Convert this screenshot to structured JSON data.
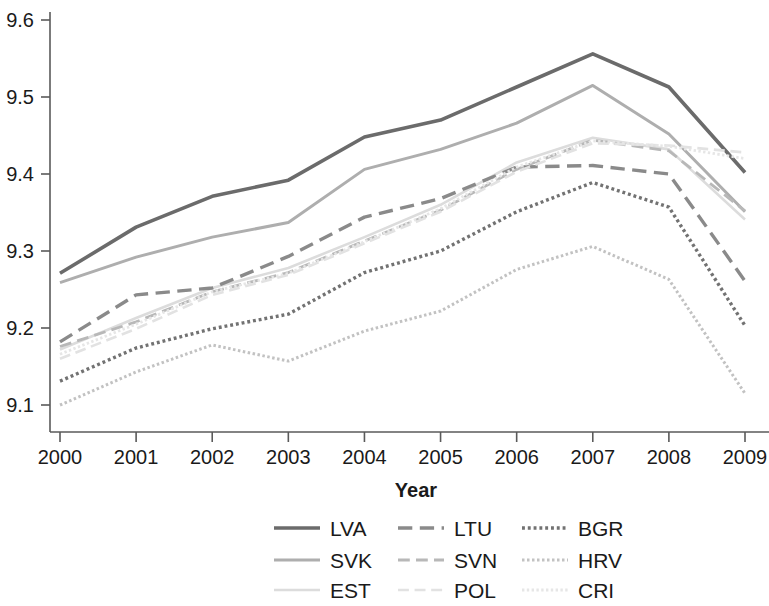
{
  "chart_data": {
    "type": "line",
    "title": "",
    "xlabel": "Year",
    "ylabel": "",
    "x": [
      2000,
      2001,
      2002,
      2003,
      2004,
      2005,
      2006,
      2007,
      2008,
      2009
    ],
    "categories": [
      "2000",
      "2001",
      "2002",
      "2003",
      "2004",
      "2005",
      "2006",
      "2007",
      "2008",
      "2009"
    ],
    "xlim": [
      2000,
      2009
    ],
    "ylim": [
      9.05,
      9.63
    ],
    "y_ticks": [
      9.1,
      9.2,
      9.3,
      9.4,
      9.5,
      9.6
    ],
    "y_tick_labels": [
      "9.1",
      "9.2",
      "9.3",
      "9.4",
      "9.5",
      "9.6"
    ],
    "grid": false,
    "legend_position": "bottom",
    "legend_columns": 3,
    "series": [
      {
        "name": "LVA",
        "style": "solid",
        "color": "#6b6b6b",
        "width": 3.6,
        "values": [
          9.271,
          9.331,
          9.371,
          9.392,
          9.448,
          9.47,
          9.513,
          9.556,
          9.513,
          9.402
        ]
      },
      {
        "name": "SVK",
        "style": "solid",
        "color": "#aeaeae",
        "width": 3.0,
        "values": [
          9.259,
          9.292,
          9.318,
          9.337,
          9.406,
          9.432,
          9.466,
          9.515,
          9.452,
          9.351
        ]
      },
      {
        "name": "EST",
        "style": "solid",
        "color": "#dcdcdc",
        "width": 2.6,
        "values": [
          9.172,
          9.213,
          9.252,
          9.278,
          9.318,
          9.36,
          9.415,
          9.447,
          9.432,
          9.341
        ]
      },
      {
        "name": "LTU",
        "style": "dashed",
        "color": "#8a8a8a",
        "width": 3.4,
        "values": [
          9.182,
          9.243,
          9.252,
          9.293,
          9.344,
          9.368,
          9.409,
          9.411,
          9.4,
          9.261
        ]
      },
      {
        "name": "SVN",
        "style": "dashed",
        "color": "#b8b8b8",
        "width": 2.8,
        "values": [
          9.176,
          9.208,
          9.247,
          9.272,
          9.313,
          9.353,
          9.406,
          9.444,
          9.43,
          9.352
        ]
      },
      {
        "name": "POL",
        "style": "dashed",
        "color": "#e2e2e2",
        "width": 2.6,
        "values": [
          9.16,
          9.199,
          9.243,
          9.269,
          9.31,
          9.351,
          9.403,
          9.44,
          9.437,
          9.428
        ]
      },
      {
        "name": "BGR",
        "style": "dotted",
        "color": "#727272",
        "width": 3.4,
        "values": [
          9.131,
          9.174,
          9.199,
          9.218,
          9.272,
          9.3,
          9.351,
          9.389,
          9.357,
          9.203
        ]
      },
      {
        "name": "HRV",
        "style": "dotted",
        "color": "#c2c2c2",
        "width": 3.0,
        "values": [
          9.1,
          9.143,
          9.178,
          9.157,
          9.196,
          9.222,
          9.276,
          9.306,
          9.263,
          9.115
        ]
      },
      {
        "name": "CRI",
        "style": "dotted",
        "color": "#e6e6e6",
        "width": 2.8,
        "values": [
          9.166,
          9.205,
          9.247,
          9.271,
          9.312,
          9.355,
          9.409,
          9.443,
          9.436,
          9.42
        ]
      }
    ]
  },
  "axis": {
    "x_title": "Year"
  },
  "legend": {
    "entries": [
      {
        "label": "LVA",
        "series": "LVA"
      },
      {
        "label": "LTU",
        "series": "LTU"
      },
      {
        "label": "BGR",
        "series": "BGR"
      },
      {
        "label": "SVK",
        "series": "SVK"
      },
      {
        "label": "SVN",
        "series": "SVN"
      },
      {
        "label": "HRV",
        "series": "HRV"
      },
      {
        "label": "EST",
        "series": "EST"
      },
      {
        "label": "POL",
        "series": "POL"
      },
      {
        "label": "CRI",
        "series": "CRI"
      }
    ]
  }
}
